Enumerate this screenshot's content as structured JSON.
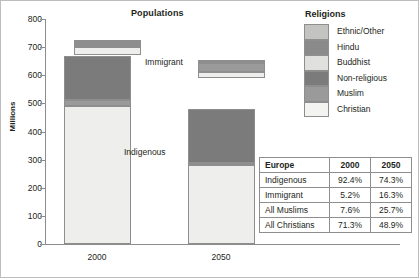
{
  "chart_data": {
    "type": "bar",
    "title": "Populations",
    "xlabel": "",
    "ylabel": "Millions",
    "ylim": [
      0,
      800
    ],
    "yticks": [
      0,
      100,
      200,
      300,
      400,
      500,
      600,
      700,
      800
    ],
    "grid": false,
    "legend_position": "right",
    "legend_title": "Religions",
    "categories": [
      "2000",
      "2050"
    ],
    "annotations": [
      "Immigrant",
      "Indigenous"
    ],
    "series": [
      {
        "name": "Christian",
        "color": "#eeeeec"
      },
      {
        "name": "Muslim",
        "color": "#9a9a9a"
      },
      {
        "name": "Non-religious",
        "color": "#7b7b7b"
      },
      {
        "name": "Buddhist",
        "color": "#e0e0de"
      },
      {
        "name": "Hindu",
        "color": "#8a8a8a"
      },
      {
        "name": "Ethnic/Other",
        "color": "#c3c3c1"
      }
    ],
    "bars": [
      {
        "category": "2000",
        "group": "Indigenous",
        "base": 0,
        "total": 670,
        "segments": [
          {
            "name": "Christian",
            "from": 0,
            "to": 490,
            "value": 490
          },
          {
            "name": "Muslim",
            "from": 490,
            "to": 512,
            "value": 22
          },
          {
            "name": "Non-religious",
            "from": 512,
            "to": 670,
            "value": 158
          }
        ]
      },
      {
        "category": "2000",
        "group": "Immigrant",
        "base": 672,
        "total": 727,
        "segments": [
          {
            "name": "Christian",
            "from": 672,
            "to": 700,
            "value": 28
          },
          {
            "name": "Buddhist",
            "from": 700,
            "to": 707,
            "value": 7
          },
          {
            "name": "Muslim",
            "from": 707,
            "to": 716,
            "value": 9
          },
          {
            "name": "Hindu",
            "from": 716,
            "to": 722,
            "value": 6
          },
          {
            "name": "Ethnic/Other",
            "from": 722,
            "to": 727,
            "value": 5
          }
        ]
      },
      {
        "category": "2050",
        "group": "Indigenous",
        "base": 0,
        "total": 480,
        "segments": [
          {
            "name": "Christian",
            "from": 0,
            "to": 281,
            "value": 281
          },
          {
            "name": "Muslim",
            "from": 281,
            "to": 289,
            "value": 8
          },
          {
            "name": "Non-religious",
            "from": 289,
            "to": 480,
            "value": 191
          }
        ]
      },
      {
        "category": "2050",
        "group": "Immigrant",
        "base": 590,
        "total": 655,
        "segments": [
          {
            "name": "Christian",
            "from": 590,
            "to": 612,
            "value": 22
          },
          {
            "name": "Muslim",
            "from": 612,
            "to": 643,
            "value": 31
          },
          {
            "name": "Hindu",
            "from": 643,
            "to": 650,
            "value": 7
          },
          {
            "name": "Ethnic/Other",
            "from": 650,
            "to": 655,
            "value": 5
          }
        ]
      }
    ]
  },
  "legend": {
    "title": "Religions",
    "items": [
      {
        "label": "Ethnic/Other",
        "color": "#c3c3c1"
      },
      {
        "label": "Hindu",
        "color": "#8a8a8a"
      },
      {
        "label": "Buddhist",
        "color": "#e0e0de"
      },
      {
        "label": "Non-religious",
        "color": "#7b7b7b"
      },
      {
        "label": "Muslim",
        "color": "#9a9a9a"
      },
      {
        "label": "Christian",
        "color": "#f3f3f1"
      }
    ]
  },
  "table": {
    "headers": [
      "Europe",
      "2000",
      "2050"
    ],
    "rows": [
      {
        "label": "Indigenous",
        "y2000": "92.4%",
        "y2050": "74.3%"
      },
      {
        "label": "Immigrant",
        "y2000": "5.2%",
        "y2050": "16.3%"
      },
      {
        "label": "All Muslims",
        "y2000": "7.6%",
        "y2050": "25.7%"
      },
      {
        "label": "All Christians",
        "y2000": "71.3%",
        "y2050": "48.9%"
      }
    ]
  },
  "axis": {
    "y_label": "Millions",
    "y_ticks": [
      "800",
      "700",
      "600",
      "500",
      "400",
      "300",
      "200",
      "100",
      "0"
    ],
    "x_labels": [
      "2000",
      "2050"
    ]
  },
  "annotations": {
    "immigrant": "Immigrant",
    "indigenous": "Indigenous"
  },
  "title": "Populations"
}
